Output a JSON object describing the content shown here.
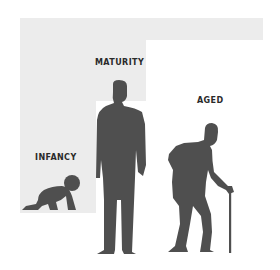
{
  "diagram": {
    "stages": [
      {
        "id": "infancy",
        "label": "INFANCY",
        "figure": "crawling-baby"
      },
      {
        "id": "maturity",
        "label": "MATURITY",
        "figure": "standing-adult"
      },
      {
        "id": "aged",
        "label": "AGED",
        "figure": "elderly-with-cane"
      }
    ]
  },
  "colors": {
    "background": "#ffffff",
    "step_fill": "#ececec",
    "figure_fill": "#4f4f4f",
    "label_text": "#2a2a2a"
  }
}
